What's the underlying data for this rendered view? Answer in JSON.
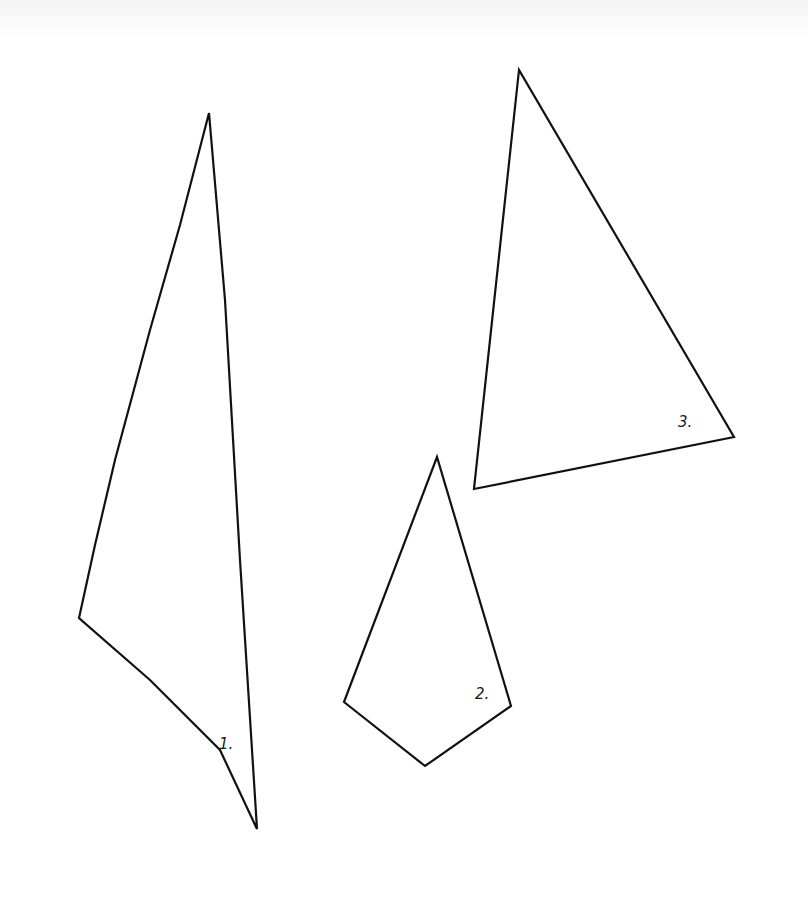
{
  "figure": {
    "background_color": "#ffffff",
    "stroke_color": "#111111",
    "shapes": [
      {
        "id": 1,
        "label": "1.",
        "type": "triangle",
        "points": "209,113 180,225 150,330 115,460 95,545 79,618 150,680 220,750 257,829 240,560 225,300",
        "label_pos": {
          "x": 219,
          "y": 737
        }
      },
      {
        "id": 2,
        "label": "2.",
        "type": "quadrilateral (kite)",
        "points": "437,457 344,702 425,766 511,706",
        "label_pos": {
          "x": 475,
          "y": 687
        }
      },
      {
        "id": 3,
        "label": "3.",
        "type": "triangle",
        "points": "519,70 474,489 734,437",
        "label_pos": {
          "x": 678,
          "y": 415
        }
      }
    ]
  }
}
